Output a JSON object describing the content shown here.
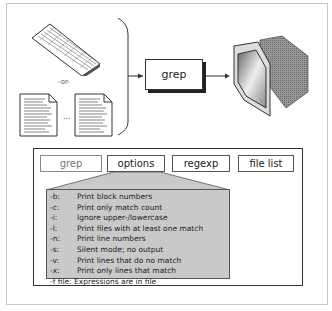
{
  "diagram": {
    "input_separator": "-or-",
    "ellipsis": "...",
    "process_label": "grep",
    "inputs": [
      "keyboard",
      "text-file",
      "text-file"
    ],
    "output": "monitor",
    "command": {
      "tabs": [
        {
          "label": "grep",
          "state": "inactive"
        },
        {
          "label": "options",
          "state": "active"
        },
        {
          "label": "regexp",
          "state": "normal"
        },
        {
          "label": "file list",
          "state": "normal"
        }
      ],
      "options": [
        {
          "flag": "-b:",
          "desc": "Print block numbers"
        },
        {
          "flag": "-c:",
          "desc": "Print only match count"
        },
        {
          "flag": "-i:",
          "desc": "Ignore upper-/lowercase"
        },
        {
          "flag": "-l:",
          "desc": "Print files with at least one match"
        },
        {
          "flag": "-n:",
          "desc": "Print line numbers"
        },
        {
          "flag": "-s:",
          "desc": "Silent mode; no output"
        },
        {
          "flag": "-v:",
          "desc": "Print lines that do no match"
        },
        {
          "flag": "-x:",
          "desc": "Print only lines that match"
        },
        {
          "flag": "-f file:",
          "desc": "Expressions are in file"
        }
      ]
    },
    "colors": {
      "options_panel": "#c9c9c9",
      "border": "#333333"
    }
  }
}
